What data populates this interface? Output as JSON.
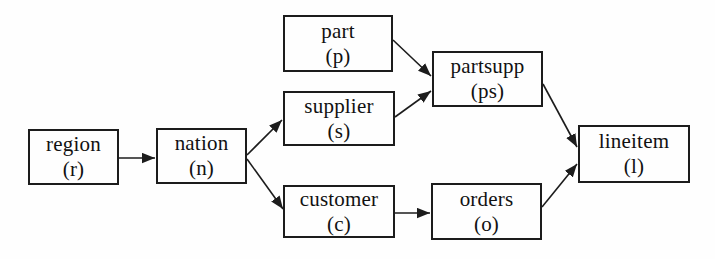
{
  "diagram": {
    "nodes": {
      "region": {
        "label": "region",
        "abbrev": "(r)"
      },
      "nation": {
        "label": "nation",
        "abbrev": "(n)"
      },
      "part": {
        "label": "part",
        "abbrev": "(p)"
      },
      "supplier": {
        "label": "supplier",
        "abbrev": "(s)"
      },
      "customer": {
        "label": "customer",
        "abbrev": "(c)"
      },
      "partsupp": {
        "label": "partsupp",
        "abbrev": "(ps)"
      },
      "orders": {
        "label": "orders",
        "abbrev": "(o)"
      },
      "lineitem": {
        "label": "lineitem",
        "abbrev": "(l)"
      }
    },
    "edges": [
      {
        "from": "region",
        "to": "nation"
      },
      {
        "from": "nation",
        "to": "supplier"
      },
      {
        "from": "nation",
        "to": "customer"
      },
      {
        "from": "part",
        "to": "partsupp"
      },
      {
        "from": "supplier",
        "to": "partsupp"
      },
      {
        "from": "customer",
        "to": "orders"
      },
      {
        "from": "partsupp",
        "to": "lineitem"
      },
      {
        "from": "orders",
        "to": "lineitem"
      }
    ],
    "colors": {
      "background": "#fefefe",
      "box_border": "#1c1c1c",
      "text": "#111111",
      "arrow": "#1c1c1c"
    }
  }
}
